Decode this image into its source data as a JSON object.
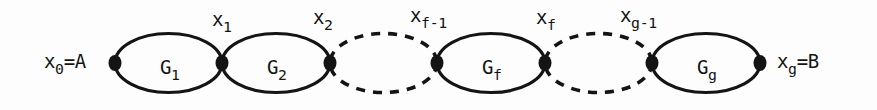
{
  "figure": {
    "name": "chain-of-graphs-diagram",
    "stroke_color": "#141414",
    "node_color": "#141414",
    "background_color": "#fdfdfd",
    "canvas": {
      "width": 877,
      "height": 110
    }
  },
  "nodes": [
    {
      "id": "x0",
      "base": "x",
      "sub": "0",
      "suffix": "=A",
      "cx": 115,
      "cy": 63,
      "label_x": 44,
      "label_y": 52,
      "label_position": "left"
    },
    {
      "id": "x1",
      "base": "x",
      "sub": "1",
      "suffix": "",
      "cx": 222,
      "cy": 63,
      "label_x": 212,
      "label_y": 10,
      "label_position": "above"
    },
    {
      "id": "x2",
      "base": "x",
      "sub": "2",
      "suffix": "",
      "cx": 330,
      "cy": 63,
      "label_x": 313,
      "label_y": 8,
      "label_position": "above"
    },
    {
      "id": "xf1",
      "base": "x",
      "sub": "f-1",
      "suffix": "",
      "cx": 437,
      "cy": 63,
      "label_x": 410,
      "label_y": 6,
      "label_position": "above"
    },
    {
      "id": "xf",
      "base": "x",
      "sub": "f",
      "suffix": "",
      "cx": 545,
      "cy": 63,
      "label_x": 536,
      "label_y": 8,
      "label_position": "above"
    },
    {
      "id": "xg1",
      "base": "x",
      "sub": "g-1",
      "suffix": "",
      "cx": 652,
      "cy": 63,
      "label_x": 620,
      "label_y": 6,
      "label_position": "above"
    },
    {
      "id": "xg",
      "base": "x",
      "sub": "g",
      "suffix": "=B",
      "cx": 760,
      "cy": 63,
      "label_x": 777,
      "label_y": 52,
      "label_position": "right"
    }
  ],
  "blocks": [
    {
      "id": "G1",
      "base": "G",
      "sub": "1",
      "style": "solid",
      "cx": 168.5,
      "cy": 63,
      "rx": 53.5,
      "ry": 29.5,
      "label_x": 160,
      "label_y": 58
    },
    {
      "id": "G2",
      "base": "G",
      "sub": "2",
      "style": "solid",
      "cx": 276,
      "cy": 63,
      "rx": 54,
      "ry": 29.5,
      "label_x": 267,
      "label_y": 58
    },
    {
      "id": "gap1",
      "base": "",
      "sub": "",
      "style": "dashed",
      "cx": 383.5,
      "cy": 63,
      "rx": 53.5,
      "ry": 29.5,
      "label_x": 0,
      "label_y": 0
    },
    {
      "id": "Gf",
      "base": "G",
      "sub": "f",
      "style": "solid",
      "cx": 491,
      "cy": 63,
      "rx": 54,
      "ry": 29.5,
      "label_x": 482,
      "label_y": 58
    },
    {
      "id": "gap2",
      "base": "",
      "sub": "",
      "style": "dashed",
      "cx": 598.5,
      "cy": 63,
      "rx": 53.5,
      "ry": 29.5,
      "label_x": 0,
      "label_y": 0
    },
    {
      "id": "Gg",
      "base": "G",
      "sub": "g",
      "style": "solid",
      "cx": 706,
      "cy": 63,
      "rx": 54,
      "ry": 29.5,
      "label_x": 697,
      "label_y": 58
    }
  ],
  "node_labels": {
    "x0": {
      "text": "x",
      "sub": "0",
      "suffix": "=A"
    },
    "x1": {
      "text": "x",
      "sub": "1",
      "suffix": ""
    },
    "x2": {
      "text": "x",
      "sub": "2",
      "suffix": ""
    },
    "xf1": {
      "text": "x",
      "sub": "f-1",
      "suffix": ""
    },
    "xf": {
      "text": "x",
      "sub": "f",
      "suffix": ""
    },
    "xg1": {
      "text": "x",
      "sub": "g-1",
      "suffix": ""
    },
    "xg": {
      "text": "x",
      "sub": "g",
      "suffix": "=B"
    }
  }
}
